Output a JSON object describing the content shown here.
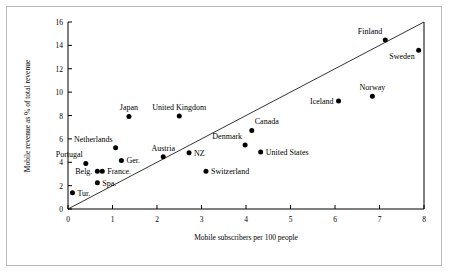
{
  "chart_data": {
    "type": "scatter",
    "title": "",
    "xlabel": "Mobile subscribers per 100 people",
    "ylabel": "Mobile revenue as % of total revenue",
    "xlim": [
      0,
      8
    ],
    "ylim": [
      0,
      16
    ],
    "xticks": [
      "0",
      "1",
      "2",
      "3",
      "4",
      "5",
      "6",
      "7",
      "8"
    ],
    "yticks": [
      "0",
      "2",
      "4",
      "6",
      "8",
      "10",
      "12",
      "14",
      "16"
    ],
    "grid": false,
    "legend": "none",
    "annotations": [
      {
        "name": "reference-line",
        "from": [
          0,
          0
        ],
        "to": [
          8,
          16
        ],
        "note": "diagonal reference line y = 2x"
      }
    ],
    "points": [
      {
        "label": "Tur.",
        "x": 0.1,
        "y": 1.4,
        "label_pos": "right"
      },
      {
        "label": "Portugal",
        "x": 0.4,
        "y": 3.9,
        "label_pos": "above-left"
      },
      {
        "label": "Belg.",
        "x": 0.66,
        "y": 3.22,
        "label_pos": "left"
      },
      {
        "label": "France.",
        "x": 0.77,
        "y": 3.22,
        "label_pos": "right"
      },
      {
        "label": "Spa.",
        "x": 0.66,
        "y": 2.25,
        "label_pos": "right"
      },
      {
        "label": "Netherlands",
        "x": 1.07,
        "y": 5.25,
        "label_pos": "above-left"
      },
      {
        "label": "Ger.",
        "x": 1.2,
        "y": 4.15,
        "label_pos": "right"
      },
      {
        "label": "Japan",
        "x": 1.37,
        "y": 7.92,
        "label_pos": "above"
      },
      {
        "label": "Austria",
        "x": 2.14,
        "y": 4.48,
        "label_pos": "above"
      },
      {
        "label": "United Kingdom",
        "x": 2.5,
        "y": 7.95,
        "label_pos": "above"
      },
      {
        "label": "NZ",
        "x": 2.72,
        "y": 4.82,
        "label_pos": "right"
      },
      {
        "label": "Switzerland",
        "x": 3.1,
        "y": 3.22,
        "label_pos": "right"
      },
      {
        "label": "Denmark",
        "x": 3.98,
        "y": 5.48,
        "label_pos": "above-left"
      },
      {
        "label": "Canada",
        "x": 4.13,
        "y": 6.72,
        "label_pos": "above-right"
      },
      {
        "label": "United States",
        "x": 4.33,
        "y": 4.88,
        "label_pos": "right"
      },
      {
        "label": "Iceland",
        "x": 6.08,
        "y": 9.25,
        "label_pos": "left"
      },
      {
        "label": "Norway",
        "x": 6.84,
        "y": 9.65,
        "label_pos": "above"
      },
      {
        "label": "Finland",
        "x": 7.13,
        "y": 14.45,
        "label_pos": "above-left"
      },
      {
        "label": "Sweden",
        "x": 7.88,
        "y": 13.58,
        "label_pos": "below-left"
      }
    ]
  }
}
